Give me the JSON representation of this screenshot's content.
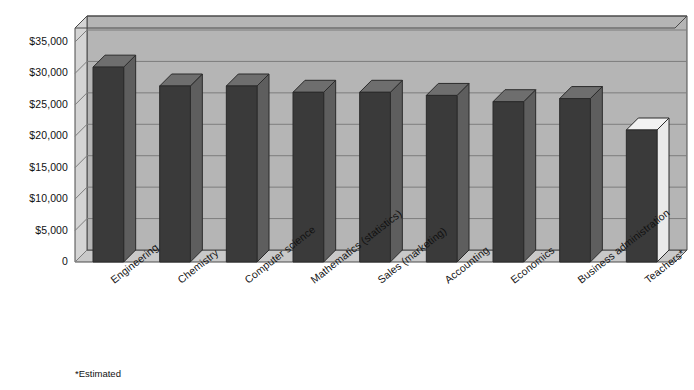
{
  "chart_data": {
    "type": "bar",
    "title": "",
    "subtitle": "",
    "xlabel": "",
    "ylabel": "",
    "categories": [
      "Engineering",
      "Chemistry",
      "Computer science",
      "Mathematics (statistics)",
      "Sales (marketing)",
      "Accounting",
      "Economics",
      "Business administration",
      "Teachers*"
    ],
    "values": [
      31000,
      28000,
      28000,
      27000,
      27000,
      26500,
      25500,
      26000,
      21000
    ],
    "ylim": [
      0,
      35000
    ],
    "ytick_labels": [
      "0",
      "$5,000",
      "$10,000",
      "$15,000",
      "$20,000",
      "$25,000",
      "$30,000",
      "$35,000"
    ],
    "ytick_values": [
      0,
      5000,
      10000,
      15000,
      20000,
      25000,
      30000,
      35000
    ],
    "grid": true,
    "legend": false,
    "legend_position": "none",
    "style": "3d-column",
    "annotations": [
      "*Estimated"
    ],
    "highlight_last_bar": true
  },
  "footnote": {
    "text": "*Estimated"
  },
  "colors": {
    "bar_front": "#3a3a3a",
    "bar_side": "#5e5e5e",
    "bar_top": "#6e6e6e",
    "bar_last_front": "#3a3a3a",
    "bar_last_top": "#f2f2f2",
    "bar_last_side": "#eaeaea",
    "wall_back": "#b5b5b5",
    "wall_left": "#d4d4d4",
    "floor": "#c9c9c9",
    "grid_line": "#7d7d7d",
    "frame": "#4a4a4a",
    "background": "#ffffff",
    "text": "#111111"
  }
}
